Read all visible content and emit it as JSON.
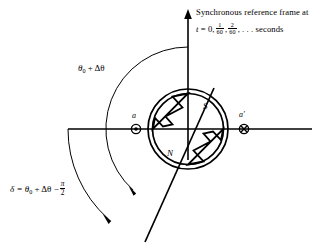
{
  "figure": {
    "type": "synchronous-machine-rotor-angle-diagram",
    "background": "#ffffff",
    "stroke": "#000000",
    "width": 336,
    "height": 246
  },
  "axes": {
    "vertical": {
      "name": "synchronous-reference-axis",
      "x": 188,
      "y_top": 11,
      "y_bottom": 160,
      "arrow": "up"
    },
    "horizontal": {
      "name": "stator-phase-a-axis",
      "y": 129,
      "x_left": 68,
      "x_right": 312
    }
  },
  "caption": {
    "line1": "Synchronous reference frame at",
    "line2_prefix": "t",
    "line2_eq": "= 0,",
    "frac1_num": "1",
    "frac1_den": "60",
    "frac_sep": ",",
    "frac2_num": "2",
    "frac2_den": "60",
    "line2_suffix": ", . . . seconds"
  },
  "labels": {
    "theta": {
      "text": "θ",
      "sub": "0",
      "plus": "+ Δθ",
      "x": 78,
      "y": 63
    },
    "delta": {
      "prefix": "δ = θ",
      "sub": "0",
      "mid": "+ Δθ −",
      "frac_num": "π",
      "frac_den": "2",
      "x": 10,
      "y": 185
    },
    "pole_s": {
      "text": "S",
      "x": 203,
      "y": 107
    },
    "pole_n": {
      "text": "N",
      "x": 168,
      "y": 152
    },
    "conductor_a": {
      "text": "a",
      "x": 131,
      "y": 115
    },
    "conductor_a_prime": {
      "text": "a′",
      "x": 240,
      "y": 114
    }
  },
  "conductors": [
    {
      "name": "conductor-a",
      "x": 136,
      "y": 129,
      "marker": "dot-circle"
    },
    {
      "name": "conductor-a-prime",
      "x": 244,
      "y": 129,
      "marker": "cross-circle"
    }
  ],
  "rotor": {
    "center_x": 188,
    "center_y": 129,
    "outer_radius": 40,
    "inner_radius": 36,
    "pole_north": "N",
    "pole_south": "S"
  },
  "arcs": {
    "theta_arc": {
      "name": "theta-zero-plus-delta-theta-arc",
      "radius": 82,
      "from_deg": 90,
      "to_deg": 228
    },
    "delta_arc": {
      "name": "delta-angle-arc",
      "radius": 120,
      "from_deg": 180,
      "to_deg": 228
    }
  },
  "rotor_axis_line": {
    "name": "rotor-direct-axis-line",
    "x1": 212,
    "y1": 92,
    "x2": 146,
    "y2": 241,
    "angle_deg": 228
  }
}
